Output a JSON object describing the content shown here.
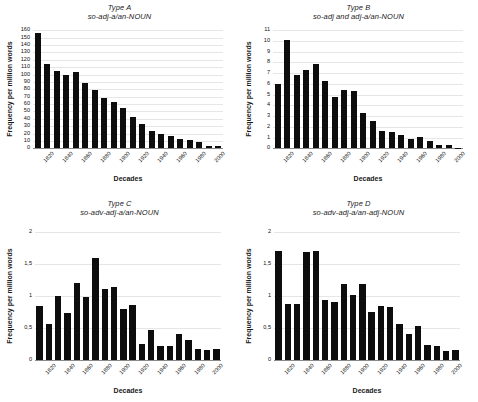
{
  "figure": {
    "panels": [
      "A",
      "B",
      "C",
      "D"
    ]
  },
  "chart_data": [
    {
      "type": "bar",
      "panel": "A",
      "title": "Type A",
      "subtitle": "so-adj-a/an-NOUN",
      "xlabel": "Decades",
      "ylabel": "Frequency per million words",
      "categories": [
        "1810",
        "1820",
        "1830",
        "1840",
        "1850",
        "1860",
        "1870",
        "1880",
        "1890",
        "1900",
        "1910",
        "1920",
        "1930",
        "1940",
        "1950",
        "1960",
        "1970",
        "1980",
        "1990",
        "2000"
      ],
      "tick_labels": [
        "1820",
        "1840",
        "1860",
        "1880",
        "1900",
        "1920",
        "1940",
        "1960",
        "1980",
        "2000"
      ],
      "values": [
        156,
        114,
        105,
        100,
        104,
        88,
        79,
        68,
        63,
        55,
        42,
        33,
        24,
        20,
        17,
        13,
        11,
        9,
        3,
        3
      ],
      "ylim": [
        0,
        160
      ],
      "yticks": [
        0,
        10,
        20,
        30,
        40,
        50,
        60,
        70,
        80,
        90,
        100,
        110,
        120,
        130,
        140,
        150,
        160
      ],
      "grid": true,
      "legend": "none"
    },
    {
      "type": "bar",
      "panel": "B",
      "title": "Type B",
      "subtitle": "so-adj and adj-a/an-NOUN",
      "xlabel": "Decades",
      "ylabel": "Frequency per million words",
      "categories": [
        "1810",
        "1820",
        "1830",
        "1840",
        "1850",
        "1860",
        "1870",
        "1880",
        "1890",
        "1900",
        "1910",
        "1920",
        "1930",
        "1940",
        "1950",
        "1960",
        "1970",
        "1980",
        "1990",
        "2000"
      ],
      "tick_labels": [
        "1820",
        "1840",
        "1860",
        "1880",
        "1900",
        "1920",
        "1940",
        "1960",
        "1980",
        "2000"
      ],
      "values": [
        6.0,
        10.1,
        6.8,
        7.3,
        7.9,
        6.3,
        4.8,
        5.4,
        5.3,
        3.25,
        2.5,
        1.6,
        1.5,
        1.2,
        0.85,
        1.05,
        0.7,
        0.35,
        0.27,
        0.07
      ],
      "ylim": [
        0,
        11
      ],
      "yticks": [
        0,
        1,
        2,
        3,
        4,
        5,
        6,
        7,
        8,
        9,
        10,
        11
      ],
      "grid": true,
      "legend": "none"
    },
    {
      "type": "bar",
      "panel": "C",
      "title": "Type C",
      "subtitle": "so-adv-adj-a/an-NOUN",
      "xlabel": "Decades",
      "ylabel": "Frequency per million words",
      "categories": [
        "1810",
        "1820",
        "1830",
        "1840",
        "1850",
        "1860",
        "1870",
        "1880",
        "1890",
        "1900",
        "1910",
        "1920",
        "1930",
        "1940",
        "1950",
        "1960",
        "1970",
        "1980",
        "1990",
        "2000"
      ],
      "tick_labels": [
        "1820",
        "1840",
        "1860",
        "1880",
        "1900",
        "1920",
        "1940",
        "1960",
        "1980",
        "2000"
      ],
      "values": [
        0.85,
        0.56,
        1.01,
        0.74,
        1.21,
        0.99,
        1.6,
        1.11,
        1.15,
        0.8,
        0.86,
        0.26,
        0.47,
        0.23,
        0.23,
        0.41,
        0.31,
        0.18,
        0.16,
        0.18
      ],
      "ylim": [
        0,
        2
      ],
      "yticks": [
        0,
        0.5,
        1,
        1.5,
        2
      ],
      "ytick_labels": [
        "0",
        "0,5",
        "1",
        "1,5",
        "2"
      ],
      "grid": true,
      "legend": "none"
    },
    {
      "type": "bar",
      "panel": "D",
      "title": "Type D",
      "subtitle": "so-adv-adj-a/an-adj-NOUN",
      "xlabel": "Decades",
      "ylabel": "Frequency per million words",
      "categories": [
        "1810",
        "1820",
        "1830",
        "1840",
        "1850",
        "1860",
        "1870",
        "1880",
        "1890",
        "1900",
        "1910",
        "1920",
        "1930",
        "1940",
        "1950",
        "1960",
        "1970",
        "1980",
        "1990",
        "2000"
      ],
      "tick_labels": [
        "1820",
        "1840",
        "1860",
        "1880",
        "1900",
        "1920",
        "1940",
        "1960",
        "1980",
        "2000"
      ],
      "values": [
        1.7,
        0.88,
        0.88,
        1.69,
        1.71,
        0.94,
        0.91,
        1.19,
        1.02,
        1.19,
        0.75,
        0.85,
        0.83,
        0.56,
        0.41,
        0.53,
        0.24,
        0.23,
        0.14,
        0.16
      ],
      "ylim": [
        0,
        2
      ],
      "yticks": [
        0,
        0.5,
        1,
        1.5,
        2
      ],
      "ytick_labels": [
        "0",
        "0,5",
        "1",
        "1,5",
        "2"
      ],
      "grid": true,
      "legend": "none"
    }
  ]
}
